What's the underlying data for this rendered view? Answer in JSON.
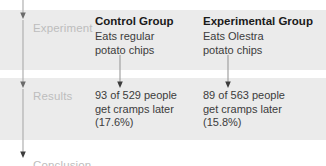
{
  "diagram": {
    "band_color": "#ebebeb",
    "background_color": "#ffffff",
    "stage_label_color": "#bdbdbd",
    "heading_color": "#1a1a1a",
    "body_text_color": "#3c3c3c",
    "arrow_color": "#8c8c8c"
  },
  "stages": {
    "experiment": "Experiment",
    "results": "Results",
    "conclusion": "Conclusion"
  },
  "icons": {
    "spine_arrow": "down-arrow-icon",
    "connector_arrow": "down-arrow-icon"
  },
  "columns": [
    {
      "id": "control",
      "experiment": {
        "title": "Control Group",
        "lines": [
          "Eats regular",
          "potato chips"
        ]
      },
      "results": {
        "lines": [
          "93 of 529 people",
          "get cramps later",
          "(17.6%)"
        ],
        "affected": 93,
        "total": 529,
        "percent": "17.6%"
      }
    },
    {
      "id": "experimental",
      "experiment": {
        "title": "Experimental Group",
        "lines": [
          "Eats Olestra",
          "potato chips"
        ]
      },
      "results": {
        "lines": [
          "89 of 563 people",
          "get cramps later",
          "(15.8%)"
        ],
        "affected": 89,
        "total": 563,
        "percent": "15.8%"
      }
    }
  ]
}
